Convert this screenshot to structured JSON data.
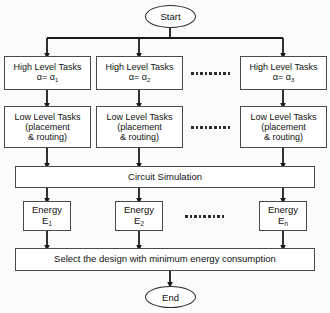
{
  "diagram": {
    "type": "flowchart",
    "colors": {
      "background": "#fbfbfb",
      "node_fill": "#ffffff",
      "node_border": "#4a4a4a",
      "terminator_border": "#2b2b2b",
      "connector": "#1a1a1a",
      "text": "#111111"
    },
    "terminators": {
      "start": "Start",
      "end": "End"
    },
    "high_level": {
      "label": "High Level Tasks",
      "items": [
        {
          "param_line": "α= α",
          "param_sub": "1"
        },
        {
          "param_line": "α= α",
          "param_sub": "2"
        },
        {
          "param_line": "α= α",
          "param_sub": "3"
        }
      ]
    },
    "low_level": {
      "line1": "Low Level Tasks",
      "line2": "(placement",
      "line3": "& routing)"
    },
    "simulation": {
      "label": "Circuit Simulation"
    },
    "energy": {
      "label": "Energy",
      "items": [
        {
          "symbol": "E",
          "sub": "1"
        },
        {
          "symbol": "E",
          "sub": "2"
        },
        {
          "symbol": "E",
          "sub": "n"
        }
      ]
    },
    "select": {
      "label": "Select the design with minimum energy consumption"
    },
    "ellipsis": {
      "dot_count": 9,
      "rows": [
        "high-level-row",
        "low-level-row",
        "energy-row"
      ]
    }
  }
}
